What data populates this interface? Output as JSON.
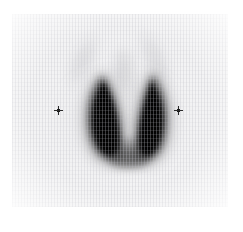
{
  "study": {
    "modality": "nuclear-medicine-scintigraphy",
    "view": "anterior",
    "region": "thyroid",
    "title": "Thyroid scintigram — anterior view"
  },
  "image": {
    "width": 243,
    "height": 232,
    "background_color": "#ffffff",
    "field_color": "#f3f3f4",
    "uptake_color": "#000000",
    "marker_color": "#2b2b2b"
  },
  "scan_field": {
    "label": "Gamma camera field of view",
    "left": 12,
    "top": 14,
    "width": 216,
    "height": 193
  },
  "findings": {
    "gland_label": "Thyroid gland",
    "left_lobe_label": "Left lobe",
    "right_lobe_label": "Right lobe",
    "isthmus_label": "Isthmus",
    "background_label": "Diffuse background activity"
  },
  "markers": [
    {
      "name": "left-reference-marker",
      "label": "+",
      "x": 58,
      "y": 110
    },
    {
      "name": "right-reference-marker",
      "label": "+",
      "x": 178,
      "y": 110
    }
  ],
  "chart_data": {
    "type": "heatmap",
    "subtitle": "Radiotracer uptake intensity map",
    "xlabel": "",
    "ylabel": "",
    "colormap": "grayscale-inverted",
    "intensity_scale": {
      "min_label": "low uptake",
      "max_label": "high uptake",
      "min_value": 0,
      "max_value": 100
    },
    "regions": [
      {
        "name": "Left lobe",
        "center_x": 100,
        "center_y": 115,
        "peak_intensity": 100
      },
      {
        "name": "Right lobe",
        "center_x": 141,
        "center_y": 115,
        "peak_intensity": 98
      },
      {
        "name": "Isthmus",
        "center_x": 120,
        "center_y": 144,
        "peak_intensity": 62
      },
      {
        "name": "Midline / pyramidal region",
        "center_x": 119,
        "center_y": 58,
        "peak_intensity": 10
      },
      {
        "name": "Background soft tissue",
        "center_x": 120,
        "center_y": 110,
        "peak_intensity": 6
      }
    ],
    "grid": false,
    "legend": false
  }
}
